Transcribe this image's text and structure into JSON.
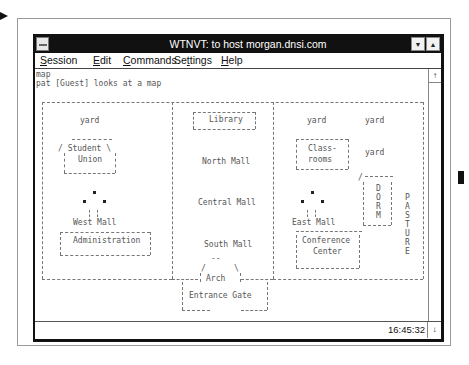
{
  "window": {
    "title": "WTNVT: to host morgan.dnsi.com",
    "minimize_glyph": "▼",
    "maximize_glyph": "▲"
  },
  "menubar": {
    "items": [
      {
        "label": "Session",
        "mnemonic": "S"
      },
      {
        "label": "Edit",
        "mnemonic": "E"
      },
      {
        "label": "Commands",
        "mnemonic": "C"
      },
      {
        "label": "Settings",
        "mnemonic": "t"
      },
      {
        "label": "Help",
        "mnemonic": "H"
      }
    ]
  },
  "terminal": {
    "lines": [
      "map",
      "pat [Guest] looks at a map"
    ]
  },
  "map": {
    "labels": {
      "yard_nw": "yard",
      "student_union_1": "/ Student \\",
      "student_union_2": "Union",
      "west_mall": "West Mall",
      "administration": "Administration",
      "library": "Library",
      "north_mall": "North Mall",
      "central_mall": "Central Mall",
      "south_mall": "South Mall",
      "arch": "Arch",
      "entrance_gate": "Entrance Gate",
      "yard_ne1": "yard",
      "yard_ne2": "yard",
      "yard_e": "yard",
      "classrooms_1": "Class-",
      "classrooms_2": "rooms",
      "east_mall": "East Mall",
      "conference_1": "Conference",
      "conference_2": "Center",
      "dorm": "D\nO\nR\nM",
      "pasture": "P\nA\nS\nT\nU\nR\nE"
    }
  },
  "statusbar": {
    "time": "16:45:32"
  },
  "scrollbar": {
    "up_glyph": "↑",
    "down_glyph": "↓"
  }
}
